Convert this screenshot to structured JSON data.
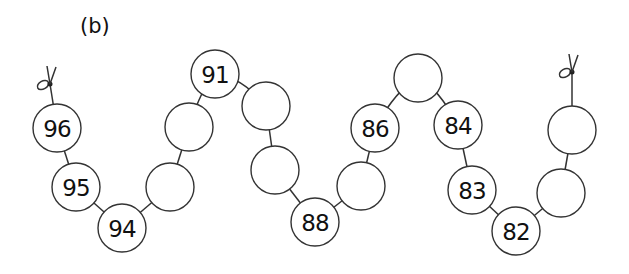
{
  "label": "(b)",
  "radius": 24,
  "beads": [
    {
      "x": 57,
      "y": 128,
      "value": "96"
    },
    {
      "x": 76,
      "y": 187,
      "value": "95"
    },
    {
      "x": 122,
      "y": 228,
      "value": "94"
    },
    {
      "x": 170,
      "y": 187,
      "value": ""
    },
    {
      "x": 189,
      "y": 127,
      "value": ""
    },
    {
      "x": 215,
      "y": 74,
      "value": "91"
    },
    {
      "x": 266,
      "y": 106,
      "value": ""
    },
    {
      "x": 275,
      "y": 170,
      "value": ""
    },
    {
      "x": 315,
      "y": 222,
      "value": "88"
    },
    {
      "x": 361,
      "y": 186,
      "value": ""
    },
    {
      "x": 375,
      "y": 128,
      "value": "86"
    },
    {
      "x": 418,
      "y": 78,
      "value": ""
    },
    {
      "x": 458,
      "y": 125,
      "value": "84"
    },
    {
      "x": 472,
      "y": 190,
      "value": "83"
    },
    {
      "x": 516,
      "y": 231,
      "value": "82"
    },
    {
      "x": 561,
      "y": 193,
      "value": ""
    },
    {
      "x": 572,
      "y": 130,
      "value": ""
    }
  ],
  "knots": [
    {
      "x": 50,
      "y": 84
    },
    {
      "x": 572,
      "y": 72
    }
  ]
}
